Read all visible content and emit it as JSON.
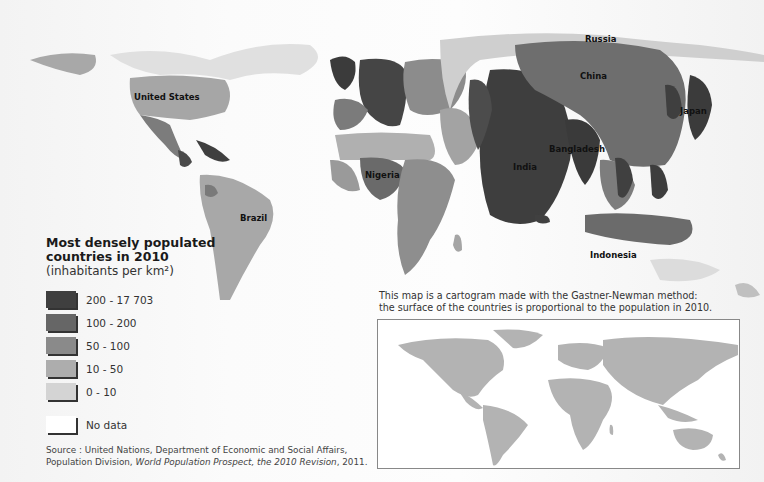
{
  "map": {
    "type": "cartogram",
    "country_labels": [
      {
        "name": "Russia",
        "x": 600,
        "y": 40
      },
      {
        "name": "China",
        "x": 594,
        "y": 79
      },
      {
        "name": "United States",
        "x": 167,
        "y": 100
      },
      {
        "name": "Japan",
        "x": 693,
        "y": 114
      },
      {
        "name": "Bangladesh",
        "x": 575,
        "y": 152
      },
      {
        "name": "India",
        "x": 525,
        "y": 170
      },
      {
        "name": "Nigeria",
        "x": 382,
        "y": 178
      },
      {
        "name": "Brazil",
        "x": 253,
        "y": 218
      },
      {
        "name": "Indonesia",
        "x": 620,
        "y": 257
      }
    ]
  },
  "legend": {
    "title_line1": "Most densely populated",
    "title_line2": "countries in 2010",
    "subtitle": "(inhabitants per km²)",
    "items": [
      {
        "label": "200 - 17 703",
        "color": "#3f3f3f"
      },
      {
        "label": "100 - 200",
        "color": "#666666"
      },
      {
        "label": "50 - 100",
        "color": "#8a8a8a"
      },
      {
        "label": "10 - 50",
        "color": "#adadad"
      },
      {
        "label": "0 - 10",
        "color": "#d4d4d4"
      },
      {
        "label": "No data",
        "color": "#ffffff"
      }
    ]
  },
  "caption": {
    "line1": "This map is a cartogram made with the Gastner-Newman method:",
    "line2": "the surface of the countries is proportional to the population in 2010."
  },
  "source": {
    "line1": "Source : United Nations, Department of Economic and Social Affairs,",
    "line2_prefix": "Population Division, ",
    "line2_title": "World Population Prospect, the 2010 Revision",
    "line2_suffix": ", 2011."
  },
  "inset": {
    "description": "Standard world map for comparison",
    "land_color": "#b3b3b3"
  }
}
